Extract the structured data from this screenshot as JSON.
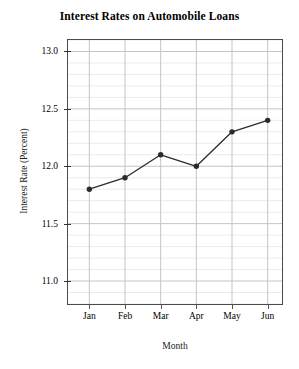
{
  "chart_data": {
    "type": "line",
    "title": "Interest Rates on Automobile Loans",
    "xlabel": "Month",
    "ylabel": "Interest Rate (Percent)",
    "categories": [
      "Jan",
      "Feb",
      "Mar",
      "Apr",
      "May",
      "Jun"
    ],
    "values": [
      11.8,
      11.9,
      12.1,
      12.0,
      12.3,
      12.4
    ],
    "series": [
      {
        "name": "Interest Rate",
        "values": [
          11.8,
          11.9,
          12.1,
          12.0,
          12.3,
          12.4
        ]
      }
    ],
    "ylim": [
      10.8,
      13.1
    ],
    "ytick_labels": [
      "13.0",
      "12.5",
      "12.0",
      "11.5",
      "11.0"
    ],
    "ytick_values": [
      13.0,
      12.5,
      12.0,
      11.5,
      11.0
    ],
    "y_major_step": 0.5,
    "y_minor_step": 0.1,
    "grid": "both",
    "legend": "none",
    "marker": "filled-circle",
    "line_color": "#2b2b2b",
    "marker_color": "#2b2b2b",
    "grid_major_color": "#c4c4c4",
    "grid_minor_color": "#ebebeb",
    "frame_color": "#4a4a4a",
    "background_color": "#ffffff"
  }
}
